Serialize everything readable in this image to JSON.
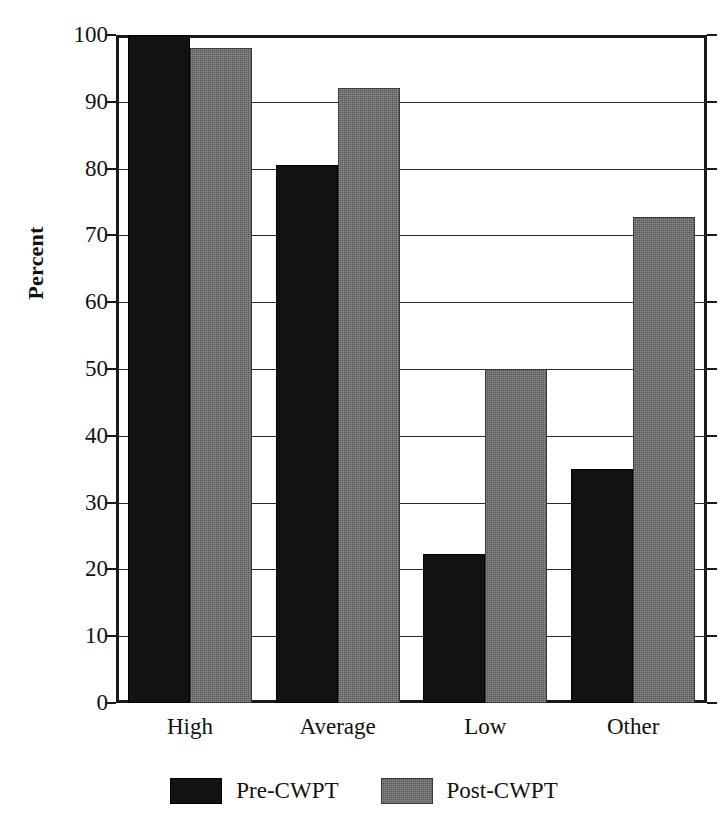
{
  "chart_data": {
    "type": "bar",
    "title": "",
    "xlabel": "",
    "ylabel": "Percent",
    "ylim": [
      0,
      100
    ],
    "ytick_step": 10,
    "yticks": [
      "100",
      "90",
      "80",
      "70",
      "60",
      "50",
      "40",
      "30",
      "20",
      "10",
      "0"
    ],
    "grid": true,
    "grid_axis": "y",
    "legend_position": "bottom-center",
    "categories": [
      "High",
      "Average",
      "Low",
      "Other"
    ],
    "series": [
      {
        "name": "Pre-CWPT",
        "color": "#121212",
        "values": [
          100,
          80.5,
          22.3,
          35
        ]
      },
      {
        "name": "Post-CWPT",
        "color": "#6e6e6e",
        "values": [
          98,
          92,
          50,
          72.7
        ]
      }
    ]
  },
  "legend": {
    "items": [
      {
        "label": "Pre-CWPT",
        "swatch": "black-swatch-icon"
      },
      {
        "label": "Post-CWPT",
        "swatch": "gray-swatch-icon"
      }
    ]
  }
}
